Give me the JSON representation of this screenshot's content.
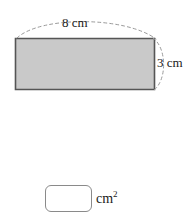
{
  "figure": {
    "shape_name": "rectangle",
    "fill_color": "#c9c9c9",
    "stroke_color": "#555555",
    "guide_color": "#9a9a9a",
    "width_label": "8 cm",
    "height_label": "3 cm"
  },
  "answer": {
    "value": "",
    "placeholder": "",
    "unit_text": "cm",
    "unit_exponent": "2"
  }
}
